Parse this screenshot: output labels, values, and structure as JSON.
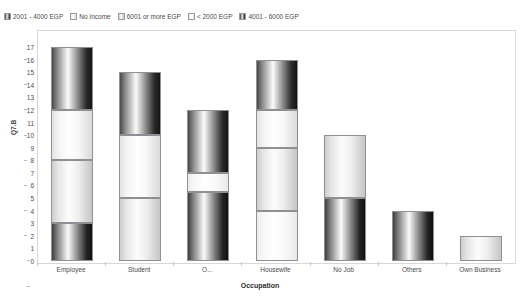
{
  "title": "",
  "legend": {
    "position": "top-left",
    "entries": [
      {
        "label": "2001 - 4000 EGP",
        "swatch": "sw-dark"
      },
      {
        "label": "No Income",
        "swatch": "sw-white"
      },
      {
        "label": "6001 or more EGP",
        "swatch": "sw-mid"
      },
      {
        "label": "< 2000 EGP",
        "swatch": "sw-light"
      },
      {
        "label": "4001 - 6000 EGP",
        "swatch": "sw-dark2"
      }
    ]
  },
  "axes": {
    "y_title": "Q7.B",
    "x_title": "Occupation",
    "y_ticks": [
      "17",
      "16",
      "15",
      "14",
      "13",
      "12",
      "11",
      "10",
      "9",
      "8",
      "7",
      "6",
      "5",
      "4",
      "3",
      "2",
      "1",
      "0"
    ],
    "ylim": [
      0,
      17
    ]
  },
  "chart_data": {
    "type": "bar",
    "stacked": true,
    "title": "",
    "xlabel": "Occupation",
    "ylabel": "Q7.B",
    "ylim": [
      0,
      17
    ],
    "grid": false,
    "legend_position": "top-left",
    "categories": [
      "Employee",
      "Student",
      "O...",
      "Housewife",
      "No Job",
      "Others",
      "Own Business"
    ],
    "series": [
      {
        "name": "2001 - 4000 EGP",
        "values": [
          5,
          5,
          5,
          4,
          0,
          0,
          0
        ]
      },
      {
        "name": "No Income",
        "values": [
          4,
          5,
          1.5,
          3,
          5,
          0,
          0
        ]
      },
      {
        "name": "6001 or more EGP",
        "values": [
          5,
          0,
          0,
          5,
          0,
          0,
          0
        ]
      },
      {
        "name": "< 2000 EGP",
        "values": [
          0,
          5,
          0,
          4,
          0,
          0,
          2
        ]
      },
      {
        "name": "4001 - 6000 EGP",
        "values": [
          3,
          0,
          5.5,
          0,
          5,
          4,
          0
        ]
      }
    ],
    "totals": [
      17,
      15,
      12,
      16,
      10,
      4,
      2
    ]
  },
  "bars": [
    {
      "category": "Employee",
      "total": 17,
      "segments": [
        {
          "series": "6001 or more EGP",
          "from": 12,
          "to": 17,
          "style": "s-dark"
        },
        {
          "series": "No Income",
          "from": 8,
          "to": 12,
          "style": "s-white"
        },
        {
          "series": "2001 - 4000 EGP",
          "from": 3,
          "to": 8,
          "style": "s-mid"
        },
        {
          "series": "4001 - 6000 EGP",
          "from": 0,
          "to": 3,
          "style": "s-dark2"
        }
      ]
    },
    {
      "category": "Student",
      "total": 15,
      "segments": [
        {
          "series": "2001 - 4000 EGP",
          "from": 10,
          "to": 15,
          "style": "s-dark"
        },
        {
          "series": "No Income",
          "from": 5,
          "to": 10,
          "style": "s-white"
        },
        {
          "series": "< 2000 EGP",
          "from": 0,
          "to": 5,
          "style": "s-mid"
        }
      ]
    },
    {
      "category": "O...",
      "total": 12,
      "segments": [
        {
          "series": "2001 - 4000 EGP",
          "from": 7,
          "to": 12,
          "style": "s-dark"
        },
        {
          "series": "No Income",
          "from": 5.5,
          "to": 7,
          "style": "s-light"
        },
        {
          "series": "4001 - 6000 EGP",
          "from": 0,
          "to": 5.5,
          "style": "s-dark2"
        }
      ]
    },
    {
      "category": "Housewife",
      "total": 16,
      "segments": [
        {
          "series": "6001 or more EGP",
          "from": 12,
          "to": 16,
          "style": "s-dark"
        },
        {
          "series": "No Income",
          "from": 9,
          "to": 12,
          "style": "s-white"
        },
        {
          "series": "2001 - 4000 EGP",
          "from": 4,
          "to": 9,
          "style": "s-mid"
        },
        {
          "series": "< 2000 EGP",
          "from": 0,
          "to": 4,
          "style": "s-light"
        }
      ]
    },
    {
      "category": "No Job",
      "total": 10,
      "segments": [
        {
          "series": "No Income",
          "from": 5,
          "to": 10,
          "style": "s-mid"
        },
        {
          "series": "4001 - 6000 EGP",
          "from": 0,
          "to": 5,
          "style": "s-dark2"
        }
      ]
    },
    {
      "category": "Others",
      "total": 4,
      "segments": [
        {
          "series": "4001 - 6000 EGP",
          "from": 0,
          "to": 4,
          "style": "s-dark2"
        }
      ]
    },
    {
      "category": "Own Business",
      "total": 2,
      "segments": [
        {
          "series": "< 2000 EGP",
          "from": 0,
          "to": 2,
          "style": "s-mid"
        }
      ]
    }
  ]
}
